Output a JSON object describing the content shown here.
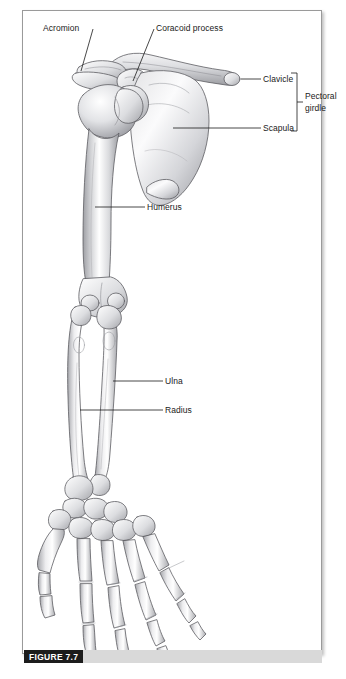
{
  "figure": {
    "caption_label": "FIGURE 7.7",
    "plate_background": "#ffffff",
    "frame_border_color": "#9a9a9a",
    "outer_background": "#e8e8e8",
    "caption_badge_bg": "#1c1c1c",
    "caption_badge_fg": "#ffffff",
    "caption_bar_bg": "#d9d9d9"
  },
  "labels": {
    "acromion": "Acromion",
    "coracoid_process": "Coracoid process",
    "clavicle": "Clavicle",
    "scapula": "Scapula",
    "pectoral_girdle_line1": "Pectoral",
    "pectoral_girdle_line2": "girdle",
    "humerus": "Humerus",
    "ulna": "Ulna",
    "radius": "Radius"
  },
  "illustration": {
    "subject": "human-upper-limb-and-pectoral-girdle-skeleton",
    "view": "anterior",
    "bone_fill_light": "#ffffff",
    "bone_fill_mid": "#d7d7d9",
    "bone_fill_dark": "#9b9ba0",
    "outline_color": "#5a5a5e",
    "leader_line_color": "#1a1a1a",
    "bones_depicted": [
      "clavicle",
      "scapula",
      "acromion",
      "coracoid process",
      "humerus",
      "ulna",
      "radius",
      "carpals",
      "metacarpals",
      "phalanges"
    ]
  }
}
